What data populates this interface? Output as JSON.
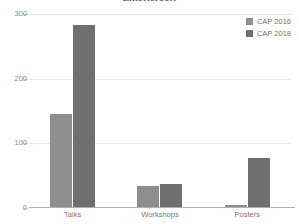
{
  "chart_data": {
    "type": "bar",
    "title": "Emerisrocri",
    "xlabel": "",
    "ylabel": "",
    "categories": [
      "Talks",
      "Workshops",
      "Posters"
    ],
    "series": [
      {
        "name": "CAP 2016",
        "color": "#8e8e8e",
        "values": [
          146,
          34,
          5
        ]
      },
      {
        "name": "CAP 2018",
        "color": "#6f6f6f",
        "values": [
          283,
          37,
          78
        ]
      }
    ],
    "ylim": [
      0,
      300
    ],
    "yticks": [
      0,
      100,
      200,
      300
    ],
    "ytick_labels": [
      "0",
      "100",
      "200",
      "300"
    ],
    "grid": true,
    "legend_position": "top-right",
    "background_color": "#ffffff",
    "gridline_color": "#e4e4e4",
    "axis_color": "#b0b0b0",
    "tick_label_color": "#888888"
  }
}
